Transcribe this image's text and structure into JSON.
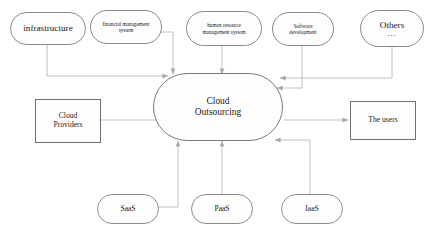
{
  "diagram": {
    "title": "Cloud Outsourcing",
    "colors": {
      "line": "#b9b9b9",
      "node_border": "#8a8a8a",
      "rect_border": "#6f6f6f",
      "text": "#1a1a1a",
      "background": "#ffffff"
    },
    "center": {
      "line1": "Cloud",
      "line2": "Outsourcing"
    },
    "top_nodes": [
      {
        "id": "infrastructure",
        "label": "infrastructure"
      },
      {
        "id": "financial-management-system",
        "line1": "financial management",
        "line2": "system"
      },
      {
        "id": "human-resource-management-system",
        "line1": "human resource",
        "line2": "management system"
      },
      {
        "id": "software-development",
        "line1": "Software",
        "line2": "development"
      },
      {
        "id": "others",
        "label": "Others",
        "ellipsis": "..."
      }
    ],
    "left_node": {
      "id": "cloud-providers",
      "line1": "Cloud",
      "line2": "Providers"
    },
    "right_node": {
      "id": "the-users",
      "label": "The users"
    },
    "bottom_nodes": [
      {
        "id": "saas",
        "label": "SaaS"
      },
      {
        "id": "paas",
        "label": "PaaS"
      },
      {
        "id": "iaas",
        "label": "IaaS"
      }
    ]
  }
}
